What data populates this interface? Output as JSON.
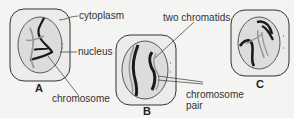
{
  "diagram": {
    "cells": [
      {
        "id": "A",
        "caption": "A"
      },
      {
        "id": "B",
        "caption": "B"
      },
      {
        "id": "C",
        "caption": "C"
      }
    ],
    "labels": {
      "cytoplasm": "cytoplasm",
      "nucleus": "nucleus",
      "chromosome": "chromosome",
      "two_chromatids": "two chromatids",
      "chromosome_pair_line1": "chromosome",
      "chromosome_pair_line2": "pair"
    },
    "colors": {
      "cell_fill": "#ececea",
      "nucleus_fill": "#dcdcda",
      "outline": "#333333",
      "chromosome_dark": "#1a1a1a",
      "chromosome_light": "#9a9a9a"
    }
  }
}
